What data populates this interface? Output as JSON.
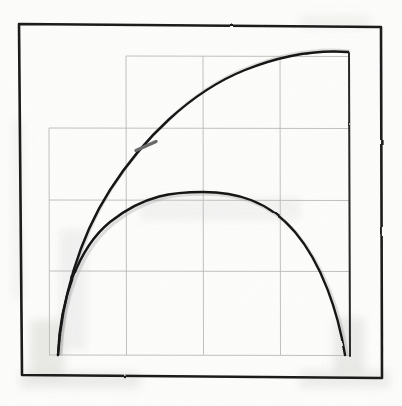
{
  "document": {
    "kind": "hand-drawn-sketch",
    "medium": "pencil-and-ink on paper",
    "title": "",
    "caption": "",
    "labels": [],
    "axis_labels": [],
    "tick_labels": []
  },
  "canvas": {
    "width": 402,
    "height": 406,
    "paper_color": "#fdfdfc",
    "ink_color": "#1a1a1a",
    "grid_color": "#b9b9b4",
    "smudge_color": "#d8d8d4"
  },
  "frame": {
    "name": "outer-hand-drawn-square",
    "stroke": "#1b1b1b",
    "stroke_width": 2.6,
    "corners": [
      {
        "x": 19,
        "y": 24
      },
      {
        "x": 381,
        "y": 27
      },
      {
        "x": 382,
        "y": 378
      },
      {
        "x": 22,
        "y": 375
      }
    ]
  },
  "grid": {
    "stroke": "#b9b9b4",
    "stroke_width": 0.9,
    "vertical_lines": [
      {
        "name": "grid-vline-left",
        "x": 49,
        "y1": 128,
        "y2": 355
      },
      {
        "name": "grid-vline-mid-left",
        "x": 126,
        "y1": 56,
        "y2": 355
      },
      {
        "name": "grid-vline-center",
        "x": 203,
        "y1": 56,
        "y2": 355
      },
      {
        "name": "grid-vline-mid-right",
        "x": 280,
        "y1": 56,
        "y2": 355
      },
      {
        "name": "grid-vline-right",
        "x": 349,
        "y1": 56,
        "y2": 355
      }
    ],
    "horizontal_lines": [
      {
        "name": "grid-hline-top",
        "y": 56,
        "x1": 126,
        "x2": 349
      },
      {
        "name": "grid-hline-upper",
        "y": 128,
        "x1": 49,
        "x2": 349
      },
      {
        "name": "grid-hline-middle",
        "y": 200,
        "x1": 49,
        "x2": 349
      },
      {
        "name": "grid-hline-lower",
        "y": 271,
        "x1": 49,
        "x2": 349
      },
      {
        "name": "grid-hline-bottom",
        "y": 355,
        "x1": 49,
        "x2": 349
      }
    ]
  },
  "chart_data": {
    "type": "line",
    "title": "",
    "xlabel": "",
    "ylabel": "",
    "xlim": [
      0,
      1
    ],
    "ylim": [
      0,
      1
    ],
    "grid": true,
    "legend": "none",
    "series": [
      {
        "name": "concave-rising-arc",
        "description": "curve rising steeply from bottom-left, flattening toward upper-right plateau",
        "x": [
          0.0,
          0.04,
          0.1,
          0.18,
          0.28,
          0.4,
          0.52,
          0.65,
          0.78,
          0.9,
          1.0
        ],
        "y": [
          0.0,
          0.2,
          0.36,
          0.5,
          0.63,
          0.75,
          0.84,
          0.91,
          0.96,
          0.99,
          1.0
        ],
        "stroke": "#151515",
        "stroke_width": 2.4
      },
      {
        "name": "semicircle-arc",
        "description": "symmetric dome from bottom-left to bottom-right, apex at center",
        "x": [
          0.0,
          0.06,
          0.14,
          0.25,
          0.37,
          0.5,
          0.63,
          0.75,
          0.86,
          0.94,
          1.0
        ],
        "y": [
          0.0,
          0.33,
          0.46,
          0.55,
          0.59,
          0.6,
          0.59,
          0.55,
          0.46,
          0.33,
          0.0
        ],
        "stroke": "#151515",
        "stroke_width": 2.4
      }
    ],
    "annotations": [
      {
        "name": "tick-on-rising-arc",
        "type": "tick-mark",
        "x": 0.26,
        "y": 0.62,
        "pixel": {
          "x": 146,
          "y": 146
        },
        "angle_deg": 66,
        "length": 22,
        "stroke": "#6b6b6b"
      },
      {
        "name": "tick-on-semicircle-apex",
        "type": "tick-mark",
        "x": 0.5,
        "y": 0.6,
        "pixel": {
          "x": 203,
          "y": 195
        },
        "angle_deg": 0,
        "length": 22,
        "stroke": "#6b6b6b"
      }
    ]
  },
  "curves": {
    "rising_arc_path": "M 58 355 C 62 300, 78 240, 110 190 C 142 140, 190 92, 245 70 C 285 54, 320 50, 348 52",
    "semicircle_path": "M 58 355 C 60 300, 78 248, 110 222 C 145 194, 175 192, 203 192 C 235 192, 268 200, 295 232 C 322 264, 338 312, 345 355"
  },
  "smudges": [
    {
      "name": "smudge-bottom-left",
      "x": 30,
      "y": 320,
      "w": 34,
      "h": 58,
      "opacity": 0.18
    },
    {
      "name": "smudge-bottom-right",
      "x": 334,
      "y": 318,
      "w": 30,
      "h": 56,
      "opacity": 0.16
    },
    {
      "name": "smudge-bottom-edge",
      "x": 20,
      "y": 372,
      "w": 120,
      "h": 16,
      "opacity": 0.14
    },
    {
      "name": "smudge-bottom-right-edge",
      "x": 300,
      "y": 370,
      "w": 90,
      "h": 18,
      "opacity": 0.13
    },
    {
      "name": "smudge-top-right",
      "x": 300,
      "y": 16,
      "w": 70,
      "h": 12,
      "opacity": 0.1
    },
    {
      "name": "smudge-left-edge",
      "x": 12,
      "y": 120,
      "w": 12,
      "h": 180,
      "opacity": 0.08
    }
  ]
}
